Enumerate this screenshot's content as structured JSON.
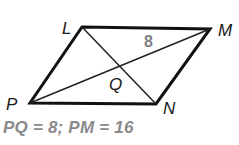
{
  "diagram": {
    "type": "parallelogram",
    "vertices": {
      "L": {
        "label": "L",
        "x": 82,
        "y": 27
      },
      "M": {
        "label": "M",
        "x": 210,
        "y": 29
      },
      "N": {
        "label": "N",
        "x": 156,
        "y": 104
      },
      "P": {
        "label": "P",
        "x": 30,
        "y": 103
      }
    },
    "intersection": {
      "label": "Q"
    },
    "segment_label": "8",
    "edges": [
      "LM",
      "MN",
      "NP",
      "PL"
    ],
    "diagonals": [
      "LN",
      "PM"
    ],
    "colors": {
      "edge": "#111111",
      "diagonal": "#222222",
      "measure": "#808080",
      "caption": "#8a8a8a"
    }
  },
  "caption": "PQ = 8; PM = 16"
}
